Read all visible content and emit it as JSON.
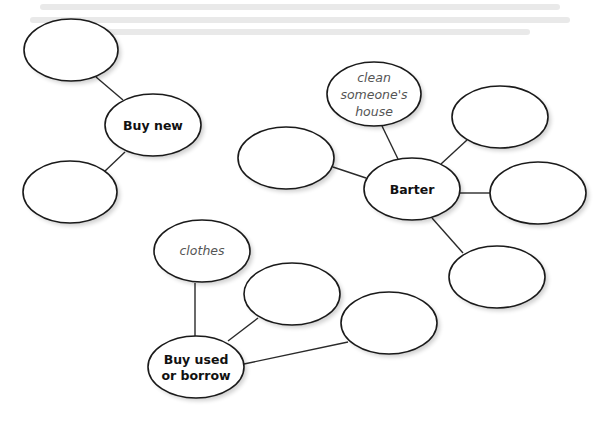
{
  "diagram": {
    "type": "mind-map",
    "background_color": "#ffffff",
    "hubs": [
      {
        "id": "buy-new",
        "label_lines": [
          "Buy new"
        ],
        "center": [
          153,
          125
        ],
        "children": [
          {
            "id": "buy-new-a",
            "label_lines": [],
            "center": [
              71,
              50
            ]
          },
          {
            "id": "buy-new-b",
            "label_lines": [],
            "center": [
              70,
              192
            ]
          }
        ]
      },
      {
        "id": "barter",
        "label_lines": [
          "Barter"
        ],
        "center": [
          412,
          189
        ],
        "children": [
          {
            "id": "barter-a",
            "label_lines": [
              "clean",
              "someone's",
              "house"
            ],
            "center": [
              374,
              94
            ]
          },
          {
            "id": "barter-b",
            "label_lines": [],
            "center": [
              286,
              158
            ]
          },
          {
            "id": "barter-c",
            "label_lines": [],
            "center": [
              500,
              117
            ]
          },
          {
            "id": "barter-d",
            "label_lines": [],
            "center": [
              538,
              193
            ]
          },
          {
            "id": "barter-e",
            "label_lines": [],
            "center": [
              497,
              277
            ]
          }
        ]
      },
      {
        "id": "buy-used",
        "label_lines": [
          "Buy used",
          "or borrow"
        ],
        "center": [
          196,
          367
        ],
        "children": [
          {
            "id": "buy-used-a",
            "label_lines": [
              "clothes"
            ],
            "center": [
              202,
              251
            ]
          },
          {
            "id": "buy-used-b",
            "label_lines": [],
            "center": [
              292,
              294
            ]
          },
          {
            "id": "buy-used-c",
            "label_lines": [],
            "center": [
              389,
              323
            ]
          }
        ]
      }
    ],
    "labels": {
      "buy_new": "Buy new",
      "barter": "Barter",
      "buy_used_line1": "Buy used",
      "buy_used_line2": "or borrow",
      "clean_line1": "clean",
      "clean_line2": "someone's",
      "clean_line3": "house",
      "clothes": "clothes"
    }
  }
}
